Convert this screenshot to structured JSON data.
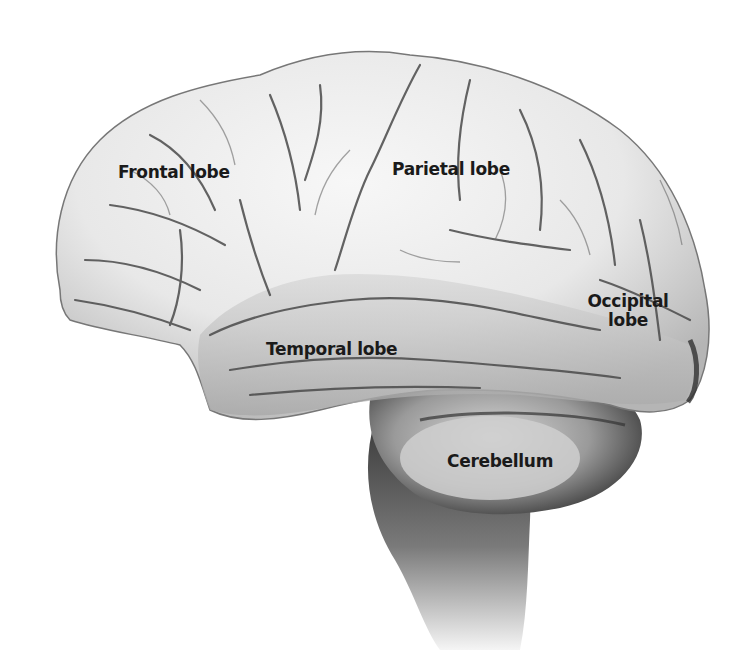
{
  "diagram": {
    "labels": [
      {
        "id": "frontal",
        "text": "Frontal lobe"
      },
      {
        "id": "parietal",
        "text": "Parietal lobe"
      },
      {
        "id": "occipital_line1",
        "text": "Occipital"
      },
      {
        "id": "occipital_line2",
        "text": "lobe"
      },
      {
        "id": "temporal",
        "text": "Temporal lobe"
      },
      {
        "id": "cerebellum",
        "text": "Cerebellum"
      }
    ],
    "colors": {
      "background": "#ffffff",
      "cortex_light": "#f2f2f2",
      "cortex_mid": "#d4d4d4",
      "sulci": "#5a5a5a",
      "shadow": "#2a2a2a",
      "label_text": "#1a1a1a"
    }
  }
}
